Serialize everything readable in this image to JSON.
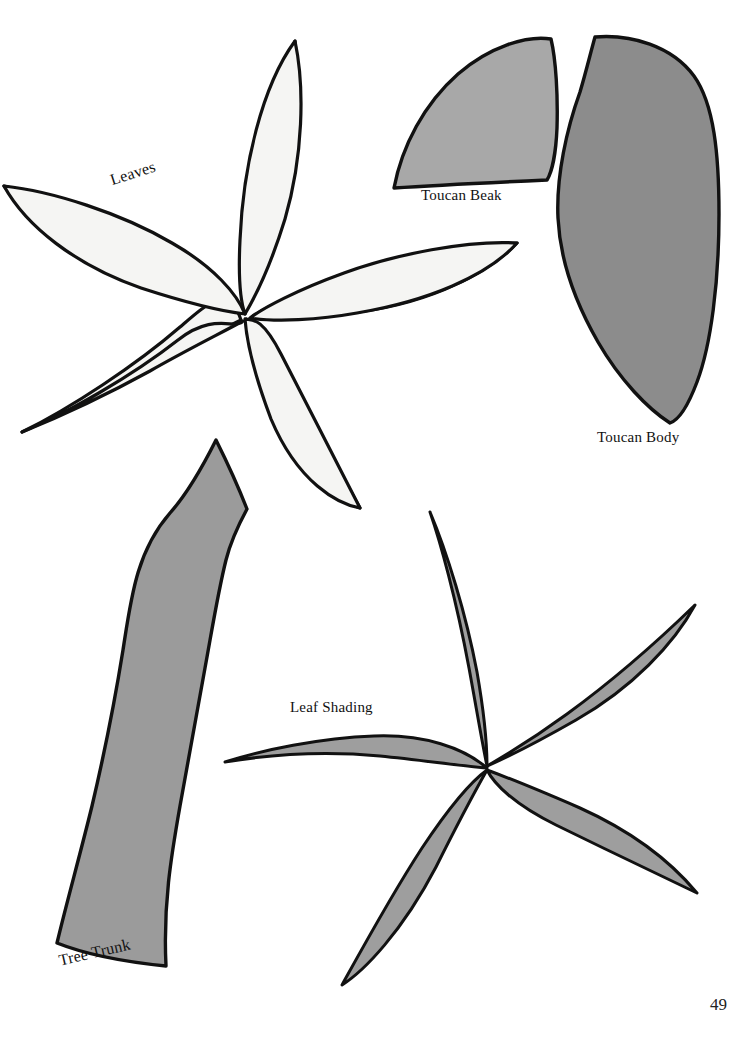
{
  "page": {
    "background_color": "#ffffff",
    "number": "49",
    "width": 749,
    "height": 1039,
    "kind": "craft-pattern-template-page"
  },
  "labels": {
    "leaves": "Leaves",
    "toucan_beak": "Toucan Beak",
    "toucan_body": "Toucan Body",
    "leaf_shading": "Leaf Shading",
    "tree_trunk": "Tree Trunk"
  },
  "colors": {
    "outline": "#111111",
    "leaves_fill": "#f5f5f3",
    "beak_fill": "#a8a8a8",
    "body_fill": "#8c8c8c",
    "trunk_fill": "#9b9b9b",
    "leaf_shading_fill": "#9e9e9e",
    "text": "#111111"
  },
  "shapes": [
    {
      "name": "leaves",
      "label": "Leaves",
      "fill": "#f5f5f3",
      "description": "five-petal leaf cluster",
      "petal_count": 5,
      "center": [
        246,
        315
      ]
    },
    {
      "name": "toucan-beak",
      "label": "Toucan Beak",
      "fill": "#a8a8a8",
      "description": "quarter-wedge curved beak",
      "bounds": [
        393,
        38,
        570,
        190
      ]
    },
    {
      "name": "toucan-body",
      "label": "Toucan Body",
      "fill": "#8c8c8c",
      "description": "tall teardrop body",
      "bounds": [
        556,
        36,
        720,
        424
      ]
    },
    {
      "name": "tree-trunk",
      "label": "Tree Trunk",
      "fill": "#9b9b9b",
      "description": "tapered curving trunk",
      "bounds": [
        55,
        438,
        250,
        968
      ]
    },
    {
      "name": "leaf-shading",
      "label": "Leaf Shading",
      "fill": "#9e9e9e",
      "description": "five crescent shading slivers",
      "sliver_count": 5,
      "center": [
        487,
        768
      ]
    }
  ]
}
